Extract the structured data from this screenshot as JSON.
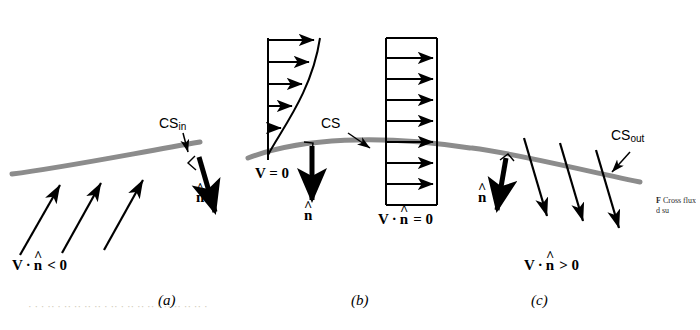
{
  "figure": {
    "panels": [
      {
        "id": "a",
        "letter": "(a)",
        "cs_label": "CS",
        "cs_sub": "in",
        "n_label": "n",
        "flux_label": "V · n < 0",
        "flux_parts": {
          "v": "V",
          "dot": "·",
          "n": "n",
          "rel": "< 0"
        }
      },
      {
        "id": "b",
        "letter": "(b)",
        "cs_label": "CS",
        "cs_sub": "",
        "n_label": "n",
        "v_zero_label": "V = 0",
        "flux_label": "V · n = 0",
        "flux_parts": {
          "v": "V",
          "dot": "·",
          "n": "n",
          "rel": "= 0"
        }
      },
      {
        "id": "c",
        "letter": "(c)",
        "cs_label": "CS",
        "cs_sub": "out",
        "n_label": "n",
        "flux_label": "V · n > 0",
        "flux_parts": {
          "v": "V",
          "dot": "·",
          "n": "n",
          "rel": "> 0"
        }
      }
    ],
    "symbols": {
      "hat": "^",
      "dot": "·"
    },
    "colors": {
      "surface": "#8c8c8c",
      "ink": "#000000",
      "page": "#ffffff",
      "ghost_text": "#cfc9b6",
      "caption_text": "#2b2b2b"
    },
    "caption": {
      "figno": "F",
      "text": "Cross flux d su"
    },
    "ghost_row_text": "·  · ·   ·· ·   ·· ·· ··    ·· ·  ·· · ·· ··    ·· · ·· ··   ·· ··  ·"
  }
}
